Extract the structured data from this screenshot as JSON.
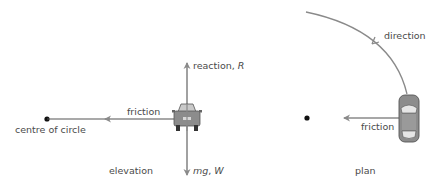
{
  "elevation": {
    "caption": "elevation",
    "centre_label": "centre of circle",
    "friction_label": "friction",
    "reaction_label": "reaction, ",
    "reaction_symbol": "R",
    "weight_symbol_mg": "mg",
    "weight_sep": ", ",
    "weight_symbol": "W"
  },
  "plan": {
    "caption": "plan",
    "direction_label": "direction",
    "friction_label": "friction"
  },
  "colors": {
    "arrow": "#8a8a8a",
    "text": "#4a4a4a",
    "car_body": "#8c8c8c",
    "dot": "#111111"
  }
}
